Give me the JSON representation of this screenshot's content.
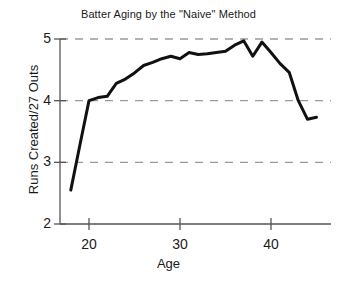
{
  "chart_data": {
    "type": "line",
    "title": "Batter Aging by the \"Naive\" Method",
    "xlabel": "Age",
    "ylabel": "Runs Created/27 Outs",
    "xlim": [
      17.0,
      45.8
    ],
    "ylim": [
      2,
      5
    ],
    "xticks": [
      20,
      30,
      40
    ],
    "xtick_labels": [
      "20",
      "30",
      "40"
    ],
    "yticks": [
      2,
      3,
      4,
      5
    ],
    "ytick_labels": [
      "2",
      "3",
      "4",
      "5"
    ],
    "grid": "horizontal-dashed",
    "grid_values": [
      3,
      4,
      5
    ],
    "legend": "none",
    "line_color": "#111111",
    "line_width": 3,
    "grid_color": "#9a9a9a",
    "axis_color": "#555555",
    "x": [
      18,
      19,
      20,
      21,
      22,
      23,
      24,
      25,
      26,
      27,
      28,
      29,
      30,
      31,
      32,
      33,
      34,
      35,
      36,
      37,
      38,
      39,
      40,
      41,
      42,
      43,
      44,
      45
    ],
    "y": [
      2.55,
      3.28,
      4.0,
      4.05,
      4.07,
      4.28,
      4.35,
      4.45,
      4.57,
      4.62,
      4.68,
      4.72,
      4.68,
      4.78,
      4.75,
      4.76,
      4.78,
      4.8,
      4.9,
      4.97,
      4.72,
      4.95,
      4.78,
      4.6,
      4.46,
      4.0,
      3.7,
      3.73
    ],
    "series": [
      {
        "name": "Runs Created/27 Outs",
        "values": [
          2.55,
          3.28,
          4.0,
          4.05,
          4.07,
          4.28,
          4.35,
          4.45,
          4.57,
          4.62,
          4.68,
          4.72,
          4.68,
          4.78,
          4.75,
          4.76,
          4.78,
          4.8,
          4.9,
          4.97,
          4.72,
          4.95,
          4.78,
          4.6,
          4.46,
          4.0,
          3.7,
          3.73
        ]
      }
    ]
  }
}
